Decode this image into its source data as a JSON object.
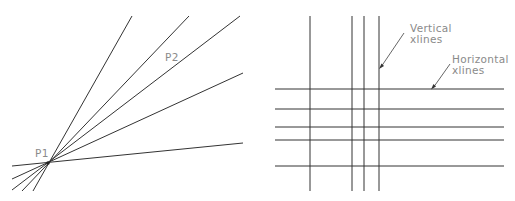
{
  "left_diagram": {
    "points": {
      "p1": {
        "label": "P1",
        "x": 48,
        "y": 163
      },
      "p2": {
        "label": "P2"
      }
    },
    "rays": [
      {
        "x1": 33,
        "y1": 191,
        "x2": 132,
        "y2": 16
      },
      {
        "x1": 22,
        "y1": 191,
        "x2": 189,
        "y2": 16
      },
      {
        "x1": 12,
        "y1": 190,
        "x2": 240,
        "y2": 16
      },
      {
        "x1": 12,
        "y1": 179,
        "x2": 243,
        "y2": 73
      },
      {
        "x1": 12,
        "y1": 166,
        "x2": 243,
        "y2": 143
      }
    ]
  },
  "right_diagram": {
    "vertical_xlines_x": [
      310,
      352,
      364,
      379
    ],
    "vertical_range": [
      16,
      191
    ],
    "horizontal_xlines_y": [
      89,
      109,
      127,
      140,
      166
    ],
    "horizontal_range": [
      275,
      504
    ],
    "annotations": {
      "vertical": {
        "line1": "Vertical",
        "line2": "xlines"
      },
      "horizontal": {
        "line1": "Horizontal",
        "line2": "xlines"
      }
    }
  }
}
